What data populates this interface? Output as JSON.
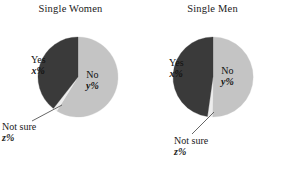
{
  "figure": {
    "background": "#ffffff",
    "panels": [
      {
        "title": "Single Women",
        "pie": {
          "cx": 78,
          "cy": 77,
          "r": 40,
          "slices": [
            {
              "name": "No",
              "label_line1": "No",
              "label_line2": "y%",
              "color": "#c4c4c4",
              "start_deg": 0,
              "end_deg": 212
            },
            {
              "name": "Not sure",
              "label_line1": "Not sure",
              "label_line2": "z%",
              "color": "#ededed",
              "start_deg": 212,
              "end_deg": 218
            },
            {
              "name": "Yes",
              "label_line1": "Yes",
              "label_line2": "x%",
              "color": "#3a3a3a",
              "start_deg": 218,
              "end_deg": 360
            }
          ]
        },
        "labels": {
          "yes": {
            "line1": "Yes",
            "line2": "x%",
            "x": 31,
            "y": 55
          },
          "no": {
            "line1": "No",
            "line2": "y%",
            "x": 86,
            "y": 70
          }
        },
        "callout": {
          "line1": "Not sure",
          "line2": "z%",
          "text_x": 2,
          "text_y": 122,
          "leader": {
            "x1": 62,
            "y1": 105,
            "x2": 32,
            "y2": 121
          }
        }
      },
      {
        "title": "Single Men",
        "pie": {
          "cx": 71,
          "cy": 77,
          "r": 40,
          "slices": [
            {
              "name": "No",
              "label_line1": "No",
              "label_line2": "y%",
              "color": "#c4c4c4",
              "start_deg": 0,
              "end_deg": 181
            },
            {
              "name": "Not sure",
              "label_line1": "Not sure",
              "label_line2": "z%",
              "color": "#ededed",
              "start_deg": 181,
              "end_deg": 188
            },
            {
              "name": "Yes",
              "label_line1": "Yes",
              "label_line2": "x%",
              "color": "#3a3a3a",
              "start_deg": 188,
              "end_deg": 360
            }
          ]
        },
        "labels": {
          "yes": {
            "line1": "Yes",
            "line2": "x%",
            "x": 27,
            "y": 58
          },
          "no": {
            "line1": "No",
            "line2": "y%",
            "x": 79,
            "y": 66
          }
        },
        "callout": {
          "line1": "Not sure",
          "line2": "z%",
          "text_x": 32,
          "text_y": 136,
          "leader": {
            "x1": 72,
            "y1": 112,
            "x2": 50,
            "y2": 134
          }
        }
      }
    ]
  },
  "chart_data": [
    {
      "type": "pie",
      "title": "Single Women",
      "categories": [
        "No",
        "Not sure",
        "Yes"
      ],
      "value_labels": [
        "y%",
        "z%",
        "x%"
      ],
      "values": [
        58.9,
        1.7,
        39.4
      ],
      "colors": [
        "#c4c4c4",
        "#ededed",
        "#3a3a3a"
      ],
      "legend": "none",
      "notes": "Values are unknown variables shown as x%, y%, z%; slice sizes estimated from drawn angles."
    },
    {
      "type": "pie",
      "title": "Single Men",
      "categories": [
        "No",
        "Not sure",
        "Yes"
      ],
      "value_labels": [
        "y%",
        "z%",
        "x%"
      ],
      "values": [
        50.3,
        1.9,
        47.8
      ],
      "colors": [
        "#c4c4c4",
        "#ededed",
        "#3a3a3a"
      ],
      "legend": "none",
      "notes": "Values are unknown variables shown as x%, y%, z%; slice sizes estimated from drawn angles."
    }
  ]
}
